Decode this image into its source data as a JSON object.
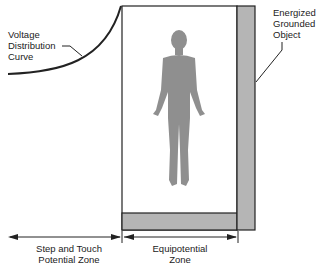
{
  "diagram": {
    "labels": {
      "curve": [
        "Voltage",
        "Distribution",
        "Curve"
      ],
      "object": [
        "Energized",
        "Grounded",
        "Object"
      ],
      "step_zone": [
        "Step and Touch",
        "Potential Zone"
      ],
      "equi_zone": [
        "Equipotential",
        "Zone"
      ]
    },
    "colors": {
      "line": "#222222",
      "fill_gray": "#b5b5b5",
      "figure": "#8f8f8f"
    }
  }
}
